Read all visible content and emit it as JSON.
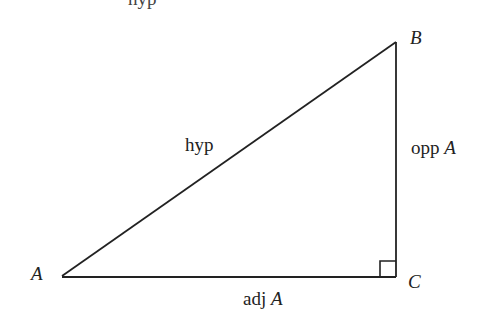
{
  "diagram": {
    "title_partial": "hyp",
    "vertices": {
      "A": {
        "label": "A",
        "x": 62,
        "y": 276
      },
      "B": {
        "label": "B",
        "x": 396,
        "y": 42
      },
      "C": {
        "label": "C",
        "x": 396,
        "y": 277
      }
    },
    "sides": {
      "hypotenuse": {
        "label": "hyp"
      },
      "opposite": {
        "label_text": "opp",
        "label_var": "A"
      },
      "adjacent": {
        "label_text": "adj",
        "label_var": "A"
      }
    },
    "right_angle_marker": {
      "at": "C",
      "size": 16
    },
    "colors": {
      "line": "#222222",
      "background": "#ffffff"
    }
  }
}
